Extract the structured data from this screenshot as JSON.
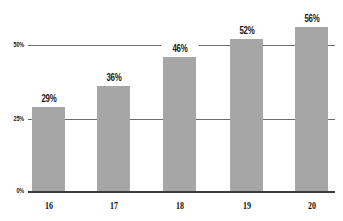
{
  "chart_data": {
    "type": "bar",
    "title": "",
    "xlabel": "",
    "ylabel": "",
    "categories": [
      "16",
      "17",
      "18",
      "19",
      "20"
    ],
    "values": [
      29,
      36,
      46,
      52,
      56
    ],
    "value_labels": [
      "29%",
      "36%",
      "46%",
      "52%",
      "56%"
    ],
    "ylim": [
      0,
      60
    ],
    "yticks": [
      0,
      25,
      50
    ],
    "ytick_labels": [
      "0%",
      "25%",
      "50%"
    ],
    "grid": true,
    "legend": null,
    "bar_color": "#a6a6a6",
    "grid_color": "#6d6d6d"
  }
}
